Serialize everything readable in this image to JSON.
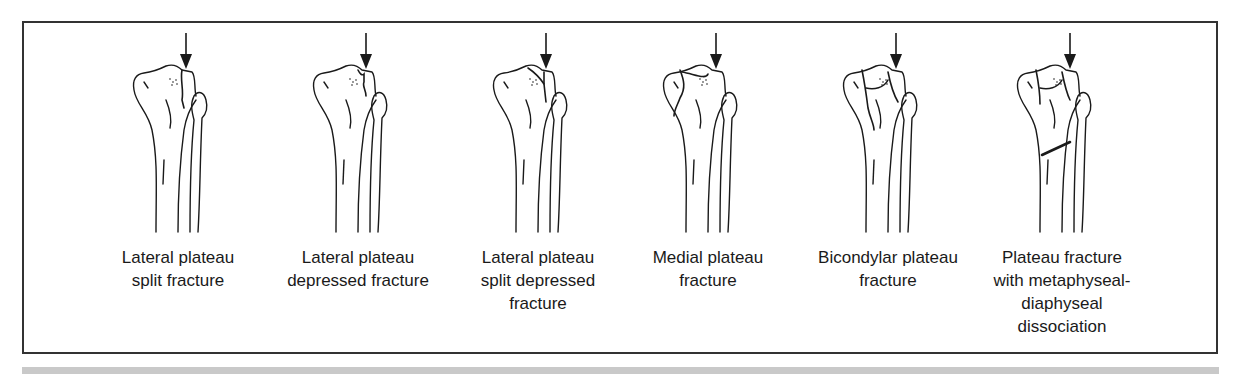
{
  "figure": {
    "arrow_meaning": "axial load",
    "panels": [
      {
        "id": "lateral-split",
        "caption_lines": [
          "Lateral plateau",
          "split fracture"
        ],
        "fracture": "split"
      },
      {
        "id": "lateral-depressed",
        "caption_lines": [
          "Lateral plateau",
          "depressed fracture"
        ],
        "fracture": "depressed"
      },
      {
        "id": "lateral-split-depressed",
        "caption_lines": [
          "Lateral plateau",
          "split depressed",
          "fracture"
        ],
        "fracture": "split-depressed"
      },
      {
        "id": "medial",
        "caption_lines": [
          "Medial plateau",
          "fracture"
        ],
        "fracture": "medial"
      },
      {
        "id": "bicondylar",
        "caption_lines": [
          "Bicondylar plateau",
          "fracture"
        ],
        "fracture": "bicondylar"
      },
      {
        "id": "metaphyseal-diaphyseal",
        "caption_lines": [
          "Plateau fracture",
          "with metaphyseal-",
          "diaphyseal",
          "dissociation"
        ],
        "fracture": "dissociation"
      }
    ]
  },
  "colors": {
    "ink": "#1a1a1a",
    "frame": "#333333",
    "band": "#c9c9c9",
    "background": "#ffffff"
  }
}
